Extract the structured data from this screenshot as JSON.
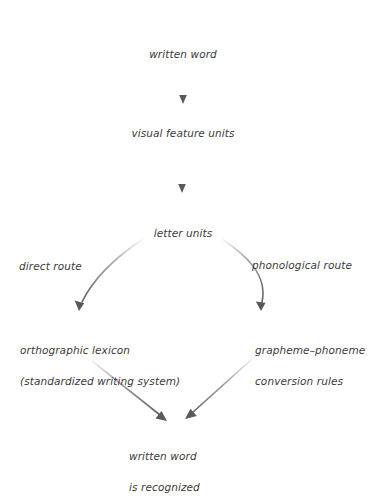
{
  "diagram": {
    "background_color": "#ffffff",
    "text_color": "#3b3b3b",
    "arrow_color": "#5a5a5a",
    "nodes": [
      {
        "id": "written-word",
        "label": "written word"
      },
      {
        "id": "visual-feature-units",
        "label": "visual feature units"
      },
      {
        "id": "letter-units",
        "label": "letter units"
      },
      {
        "id": "orthographic-lexicon",
        "label_line1": "orthographic lexicon",
        "label_line2": "(standardized writing system)"
      },
      {
        "id": "grapheme-phoneme-rules",
        "label_line1": "grapheme–phoneme",
        "label_line2": "conversion rules"
      },
      {
        "id": "written-word-recognized",
        "label_line1": "written word",
        "label_line2": "is recognized"
      }
    ],
    "edge_labels": [
      {
        "id": "direct-route",
        "label": "direct route"
      },
      {
        "id": "phonological-route",
        "label": "phonological route"
      }
    ]
  }
}
